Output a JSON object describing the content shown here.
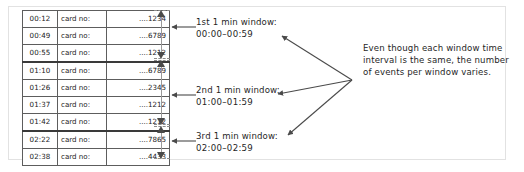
{
  "figure": {
    "table": {
      "columns": [
        "time",
        "card_label",
        "card_number"
      ],
      "rows": [
        {
          "time": "00:12",
          "label": "card no:",
          "card": "....1234"
        },
        {
          "time": "00:49",
          "label": "card no:",
          "card": "....6789"
        },
        {
          "time": "00:55",
          "label": "card no:",
          "card": "....1212"
        },
        {
          "time": "01:10",
          "label": "card no:",
          "card": "....6789"
        },
        {
          "time": "01:26",
          "label": "card no:",
          "card": "....2345"
        },
        {
          "time": "01:37",
          "label": "card no:",
          "card": "....1212"
        },
        {
          "time": "01:42",
          "label": "card no:",
          "card": "....1212"
        },
        {
          "time": "02:22",
          "label": "card no:",
          "card": "....7865"
        },
        {
          "time": "02:38",
          "label": "card no:",
          "card": "....4433"
        }
      ]
    },
    "windows": [
      {
        "name": "1st 1 min window:",
        "range": "00:00–00:59",
        "row_start": 0,
        "row_end": 2,
        "event_count": 3
      },
      {
        "name": "2nd 1 min window:",
        "range": "01:00–01:59",
        "row_start": 3,
        "row_end": 6,
        "event_count": 4
      },
      {
        "name": "3rd 1 min window:",
        "range": "02:00–02:59",
        "row_start": 7,
        "row_end": 8,
        "event_count": 2
      }
    ],
    "callout": "Even though each window time interval is the same, the number of events per window varies.",
    "colors": {
      "ink": "#1f1f1f",
      "table_border": "#5d5d5d",
      "group_rule": "#3a3a3a",
      "arrow": "#4a4a4a",
      "frame": "#e2e2e2",
      "background": "#ffffff"
    }
  }
}
